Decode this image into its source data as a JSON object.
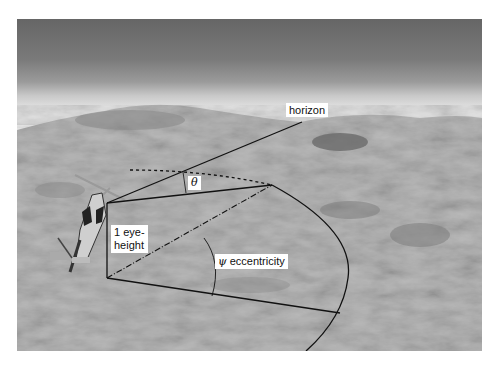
{
  "figure": {
    "labels": {
      "horizon": "horizon",
      "theta_symbol": "θ",
      "eye_height_line1": "1 eye-",
      "eye_height_line2": "height",
      "psi_symbol": "ψ",
      "eccentricity": "eccentricity"
    },
    "colors": {
      "sky_top": "#6e6e6e",
      "sky_band": "#9a9a9a",
      "haze": "#dcdcdc",
      "terrain": "#b5b5b5",
      "terrain_dark": "#7d7d7d",
      "lines": "#111111"
    }
  }
}
